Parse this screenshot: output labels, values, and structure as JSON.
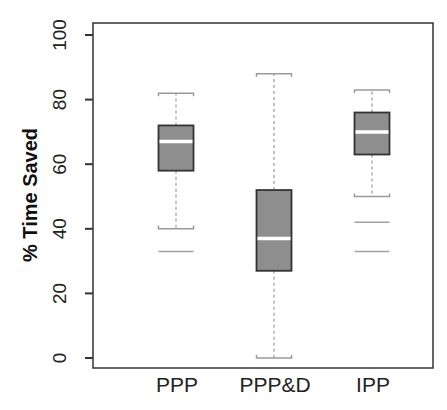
{
  "chart_data": {
    "type": "boxplot",
    "title": "",
    "xlabel": "",
    "ylabel": "% Time Saved",
    "ylim": [
      0,
      100
    ],
    "yticks": [
      0,
      20,
      40,
      60,
      80,
      100
    ],
    "grid": false,
    "legend": null,
    "categories": [
      "PPP",
      "PPP&D",
      "IPP"
    ],
    "series": [
      {
        "name": "PPP",
        "whisker_low": 40,
        "q1": 58,
        "median": 67,
        "q3": 72,
        "whisker_high": 82,
        "outliers": [
          33
        ]
      },
      {
        "name": "PPP&D",
        "whisker_low": 0,
        "q1": 27,
        "median": 37,
        "q3": 52,
        "whisker_high": 88,
        "outliers": []
      },
      {
        "name": "IPP",
        "whisker_low": 50,
        "q1": 63,
        "median": 70,
        "q3": 76,
        "whisker_high": 83,
        "outliers": [
          42,
          33
        ]
      }
    ],
    "colors": {
      "box_fill": "#8e8e8e",
      "box_border": "#333333",
      "median": "#ffffff",
      "whisker": "#9a9a9a",
      "outlier": "#a0a0a0",
      "axis": "#333333"
    }
  }
}
